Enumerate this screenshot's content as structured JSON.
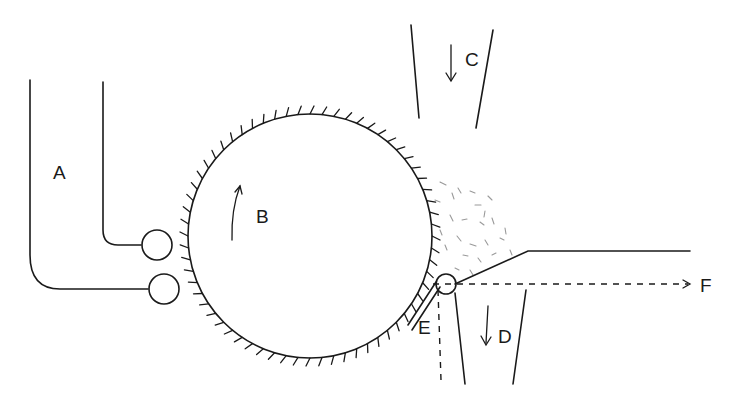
{
  "diagram": {
    "type": "mechanical-schematic",
    "labels": {
      "A": "A",
      "B": "B",
      "C": "C",
      "D": "D",
      "E": "E",
      "F": "F"
    },
    "components": [
      {
        "id": "A",
        "description": "feed chute"
      },
      {
        "id": "B",
        "description": "toothed rotating cylinder"
      },
      {
        "id": "C",
        "description": "air inlet duct (downward flow)"
      },
      {
        "id": "D",
        "description": "waste outlet duct (downward flow)"
      },
      {
        "id": "E",
        "description": "mote knife / blade"
      },
      {
        "id": "F",
        "description": "output direction"
      }
    ],
    "colors": {
      "line": "#1a1a1a",
      "fibers": "#9a9a9a",
      "background": "#ffffff"
    }
  }
}
